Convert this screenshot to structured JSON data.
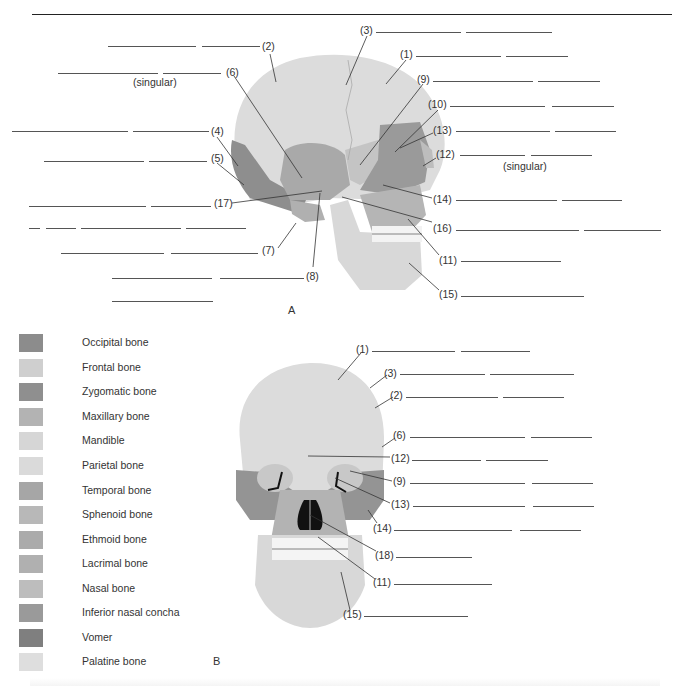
{
  "figure_a": {
    "panel_label": "A",
    "singular_note_left": "(singular)",
    "singular_note_right": "(singular)",
    "callouts": [
      {
        "id": "2",
        "label": "(2)",
        "x": 262,
        "y": 42
      },
      {
        "id": "6",
        "label": "(6)",
        "x": 226,
        "y": 66
      },
      {
        "id": "4",
        "label": "(4)",
        "x": 211,
        "y": 125
      },
      {
        "id": "5",
        "label": "(5)",
        "x": 211,
        "y": 152
      },
      {
        "id": "17",
        "label": "(17)",
        "x": 214,
        "y": 196
      },
      {
        "id": "7",
        "label": "(7)",
        "x": 262,
        "y": 243
      },
      {
        "id": "8",
        "label": "(8)",
        "x": 306,
        "y": 267
      },
      {
        "id": "3",
        "label": "(3)",
        "x": 360,
        "y": 24
      },
      {
        "id": "1",
        "label": "(1)",
        "x": 400,
        "y": 48
      },
      {
        "id": "9",
        "label": "(9)",
        "x": 417,
        "y": 72
      },
      {
        "id": "10",
        "label": "(10)",
        "x": 428,
        "y": 97
      },
      {
        "id": "13",
        "label": "(13)",
        "x": 433,
        "y": 123
      },
      {
        "id": "12",
        "label": "(12)",
        "x": 436,
        "y": 147
      },
      {
        "id": "14",
        "label": "(14)",
        "x": 433,
        "y": 195
      },
      {
        "id": "16",
        "label": "(16)",
        "x": 433,
        "y": 222
      },
      {
        "id": "11",
        "label": "(11)",
        "x": 439,
        "y": 253
      },
      {
        "id": "15",
        "label": "(15)",
        "x": 439,
        "y": 287
      }
    ]
  },
  "figure_b": {
    "panel_label": "B",
    "callouts": [
      {
        "id": "1",
        "label": "(1)",
        "x": 356,
        "y": 343
      },
      {
        "id": "3",
        "label": "(3)",
        "x": 384,
        "y": 366
      },
      {
        "id": "2",
        "label": "(2)",
        "x": 390,
        "y": 389
      },
      {
        "id": "6",
        "label": "(6)",
        "x": 393,
        "y": 429
      },
      {
        "id": "12",
        "label": "(12)",
        "x": 391,
        "y": 452
      },
      {
        "id": "9",
        "label": "(9)",
        "x": 393,
        "y": 475
      },
      {
        "id": "13",
        "label": "(13)",
        "x": 391,
        "y": 498
      },
      {
        "id": "14",
        "label": "(14)",
        "x": 373,
        "y": 522
      },
      {
        "id": "18",
        "label": "(18)",
        "x": 375,
        "y": 549
      },
      {
        "id": "11",
        "label": "(11)",
        "x": 373,
        "y": 576
      },
      {
        "id": "15",
        "label": "(15)",
        "x": 343,
        "y": 608
      }
    ]
  },
  "legend": {
    "items": [
      {
        "label": "Occipital bone",
        "color": "#8c8c8c"
      },
      {
        "label": "Frontal bone",
        "color": "#cfcfcf"
      },
      {
        "label": "Zygomatic bone",
        "color": "#8f8f8f"
      },
      {
        "label": "Maxillary bone",
        "color": "#b3b3b3"
      },
      {
        "label": "Mandible",
        "color": "#d6d6d6"
      },
      {
        "label": "Parietal bone",
        "color": "#dadada"
      },
      {
        "label": "Temporal bone",
        "color": "#a6a6a6"
      },
      {
        "label": "Sphenoid bone",
        "color": "#b8b8b8"
      },
      {
        "label": "Ethmoid bone",
        "color": "#ababab"
      },
      {
        "label": "Lacrimal bone",
        "color": "#b0b0b0"
      },
      {
        "label": "Nasal bone",
        "color": "#bdbdbd"
      },
      {
        "label": "Inferior nasal concha",
        "color": "#9a9a9a"
      },
      {
        "label": "Vomer",
        "color": "#7f7f7f"
      },
      {
        "label": "Palatine bone",
        "color": "#dedede"
      }
    ]
  }
}
